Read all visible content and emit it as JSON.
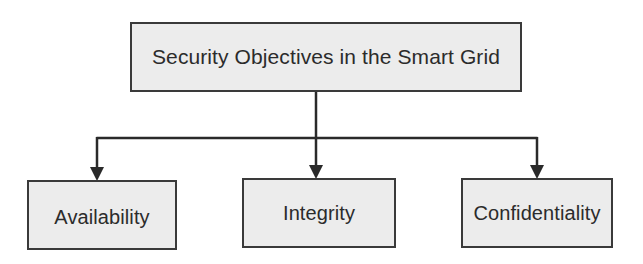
{
  "diagram": {
    "type": "hierarchy",
    "root": {
      "label": "Security Objectives in the Smart Grid"
    },
    "children": [
      {
        "label": "Availability"
      },
      {
        "label": "Integrity"
      },
      {
        "label": "Confidentiality"
      }
    ],
    "edges": [
      {
        "from": "Security Objectives in the Smart Grid",
        "to": "Availability"
      },
      {
        "from": "Security Objectives in the Smart Grid",
        "to": "Integrity"
      },
      {
        "from": "Security Objectives in the Smart Grid",
        "to": "Confidentiality"
      }
    ],
    "colors": {
      "box_fill": "#ececec",
      "box_border": "#3a3a3a",
      "text": "#2b2b2b",
      "connector": "#2a2a2a",
      "background": "#ffffff"
    }
  }
}
